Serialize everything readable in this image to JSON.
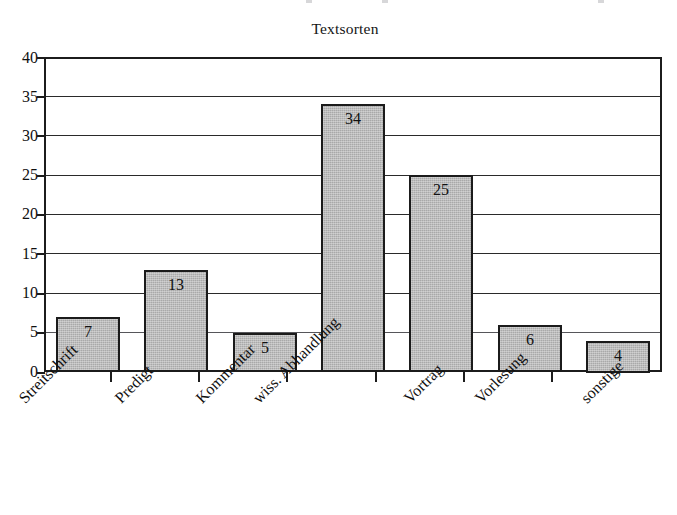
{
  "chart_data": {
    "type": "bar",
    "title": "Textsorten",
    "xlabel": "",
    "ylabel": "",
    "categories": [
      "Streitschrift",
      "Predigt",
      "Kommentar",
      "wiss. Abhandlung",
      "Vortrag",
      "Vorlesung",
      "sonstige"
    ],
    "values": [
      7,
      13,
      5,
      34,
      25,
      6,
      4
    ],
    "value_labels": [
      "7",
      "13",
      "5",
      "34",
      "25",
      "6",
      "4"
    ],
    "ylim": [
      0,
      40
    ],
    "ytick_values": [
      0,
      5,
      10,
      15,
      20,
      25,
      30,
      35,
      40
    ],
    "ytick_labels": [
      "0",
      "5",
      "10",
      "15",
      "20",
      "25",
      "30",
      "35",
      "40"
    ],
    "grid": true,
    "grid_axis": "y",
    "legend": false,
    "legend_position": "none",
    "bar_fill_color": "#a9a9a9",
    "bar_border_color": "#1b1b1b",
    "axis_color": "#1c1c1c",
    "background_color": "#ffffff",
    "xtick_label_rotation": -45
  }
}
